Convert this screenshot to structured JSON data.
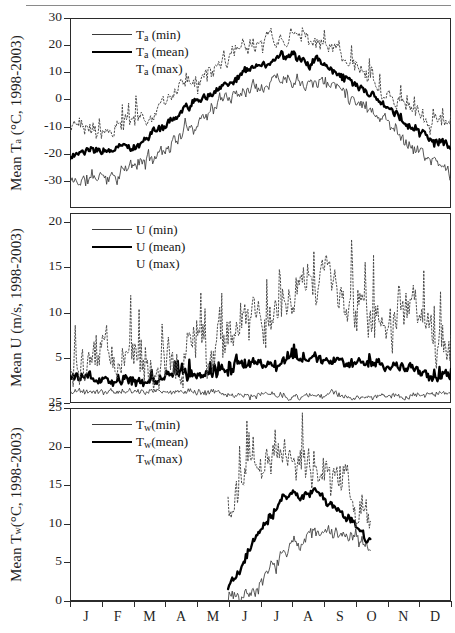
{
  "figure": {
    "title": "",
    "panel_count": 3,
    "period": "1998-2003"
  },
  "xaxis": {
    "months": [
      "J",
      "F",
      "M",
      "A",
      "M",
      "J",
      "J",
      "A",
      "S",
      "O",
      "N",
      "D"
    ],
    "label": "",
    "range_days": [
      1,
      365
    ]
  },
  "chart_data": [
    {
      "type": "line",
      "panel": "top",
      "title": "",
      "xlabel": "",
      "ylabel": "Mean Tₐ (°C, 1998-2003)",
      "ylabel_parts": {
        "prefix": "Mean T",
        "sub": "a",
        "suffix": " (°C, 1998-2003)"
      },
      "ylim": [
        -40,
        30
      ],
      "yticks": [
        30,
        20,
        10,
        0,
        -10,
        -20,
        -30
      ],
      "ytick_labels": [
        "30",
        "20",
        "10",
        "0",
        "-10",
        "-20",
        "-30"
      ],
      "grid": false,
      "legend_position": "top-left",
      "legend": [
        {
          "key": "min",
          "label_prefix": "T",
          "label_sub": "a",
          "label_suffix": " (min)",
          "style": "thin"
        },
        {
          "key": "mean",
          "label_prefix": "T",
          "label_sub": "a",
          "label_suffix": " (mean)",
          "style": "thick"
        },
        {
          "key": "max",
          "label_prefix": "T",
          "label_sub": "a",
          "label_suffix": " (max)",
          "style": "dotted"
        }
      ],
      "categories": [
        "Jan",
        "Feb",
        "Mar",
        "Apr",
        "May",
        "Jun",
        "Jul",
        "Aug",
        "Sep",
        "Oct",
        "Nov",
        "Dec"
      ],
      "series": [
        {
          "name": "Ta (min)",
          "style": "thin",
          "monthly_values": [
            -30.5,
            -28.0,
            -24.0,
            -15.0,
            -4.0,
            4.0,
            8.5,
            8.0,
            3.0,
            -6.0,
            -18.0,
            -27.0
          ],
          "noise_amp": 3.4,
          "seed": 11
        },
        {
          "name": "Ta (mean)",
          "style": "thick",
          "monthly_values": [
            -20.5,
            -19.0,
            -15.5,
            -7.0,
            2.0,
            10.0,
            14.5,
            14.0,
            8.0,
            -1.0,
            -11.0,
            -18.5
          ],
          "noise_amp": 2.0,
          "seed": 23
        },
        {
          "name": "Ta (max)",
          "style": "dotted",
          "monthly_values": [
            -11.0,
            -10.5,
            -7.0,
            1.0,
            9.0,
            17.5,
            22.0,
            21.0,
            14.0,
            4.0,
            -5.0,
            -10.5
          ],
          "noise_amp": 3.6,
          "seed": 37
        }
      ]
    },
    {
      "type": "line",
      "panel": "middle",
      "title": "",
      "xlabel": "",
      "ylabel": "Mean U (m/s, 1998-2003)",
      "ylabel_parts": {
        "prefix": "Mean U (m/s, 1998-2003)",
        "sub": "",
        "suffix": ""
      },
      "ylim": [
        0,
        21
      ],
      "yticks": [
        20,
        15,
        10,
        5,
        0
      ],
      "ytick_labels": [
        "20",
        "15",
        "10",
        "5",
        "25"
      ],
      "grid": false,
      "legend_position": "top-left",
      "legend": [
        {
          "key": "min",
          "label_prefix": "U (min)",
          "label_sub": "",
          "label_suffix": "",
          "style": "thin"
        },
        {
          "key": "mean",
          "label_prefix": "U (mean)",
          "label_sub": "",
          "label_suffix": "",
          "style": "thick"
        },
        {
          "key": "max",
          "label_prefix": "U (max)",
          "label_sub": "",
          "label_suffix": "",
          "style": "dotted"
        }
      ],
      "categories": [
        "Jan",
        "Feb",
        "Mar",
        "Apr",
        "May",
        "Jun",
        "Jul",
        "Aug",
        "Sep",
        "Oct",
        "Nov",
        "Dec"
      ],
      "series": [
        {
          "name": "U (min)",
          "style": "thin",
          "monthly_values": [
            1.2,
            1.2,
            1.3,
            1.3,
            1.2,
            0.9,
            0.8,
            0.8,
            0.8,
            0.9,
            1.0,
            1.1
          ],
          "noise_amp": 0.45,
          "seed": 5
        },
        {
          "name": "U (mean)",
          "style": "thick",
          "monthly_values": [
            3.1,
            2.7,
            2.8,
            3.0,
            3.3,
            4.0,
            4.5,
            4.7,
            4.6,
            4.3,
            3.6,
            3.1
          ],
          "noise_amp": 0.75,
          "seed": 17
        },
        {
          "name": "U (max)",
          "style": "dotted",
          "monthly_values": [
            5.5,
            4.2,
            4.2,
            4.6,
            6.5,
            9.5,
            11.5,
            12.5,
            12.0,
            10.5,
            8.5,
            7.5
          ],
          "noise_amp": 3.2,
          "seed": 29
        }
      ]
    },
    {
      "type": "line",
      "panel": "bottom",
      "title": "",
      "xlabel": "",
      "ylabel": "Mean T_w (°C, 1998-2003)",
      "ylabel_parts": {
        "prefix": "Mean T",
        "sub": "w",
        "suffix": "(°C, 1998-2003)"
      },
      "ylim": [
        0,
        25
      ],
      "yticks": [
        25,
        20,
        15,
        10,
        5,
        0
      ],
      "ytick_labels": [
        "25",
        "20",
        "15",
        "10",
        "5",
        "0"
      ],
      "grid": false,
      "legend_position": "top-left",
      "legend": [
        {
          "key": "min",
          "label_prefix": "T",
          "label_sub": "w",
          "label_suffix": "(min)",
          "style": "thin"
        },
        {
          "key": "mean",
          "label_prefix": "T",
          "label_sub": "w",
          "label_suffix": "(mean)",
          "style": "thick"
        },
        {
          "key": "max",
          "label_prefix": "T",
          "label_sub": "w",
          "label_suffix": "(max)",
          "style": "dotted"
        }
      ],
      "data_window_days": [
        152,
        288
      ],
      "categories": [
        "Jun",
        "Jul",
        "Aug",
        "Sep",
        "Oct"
      ],
      "series": [
        {
          "name": "Tw (min)",
          "style": "thin",
          "monthly_values": [
            0.8,
            2.5,
            8.0,
            8.5,
            7.0
          ],
          "noise_amp": 1.3,
          "seed": 7
        },
        {
          "name": "Tw (mean)",
          "style": "thick",
          "monthly_values": [
            2.0,
            10.0,
            14.0,
            12.0,
            8.0
          ],
          "noise_amp": 0.8,
          "seed": 19
        },
        {
          "name": "Tw (max)",
          "style": "dotted",
          "monthly_values": [
            12.0,
            19.0,
            19.0,
            16.0,
            11.0
          ],
          "noise_amp": 3.0,
          "seed": 31
        }
      ]
    }
  ],
  "colors": {
    "line_min": "#3a3a3a",
    "line_mean": "#000000",
    "line_max": "#4a4a4a",
    "axis": "#2b2b2b",
    "text": "#1f1f1f",
    "background": "#ffffff",
    "rule": "#8a8a8a"
  }
}
